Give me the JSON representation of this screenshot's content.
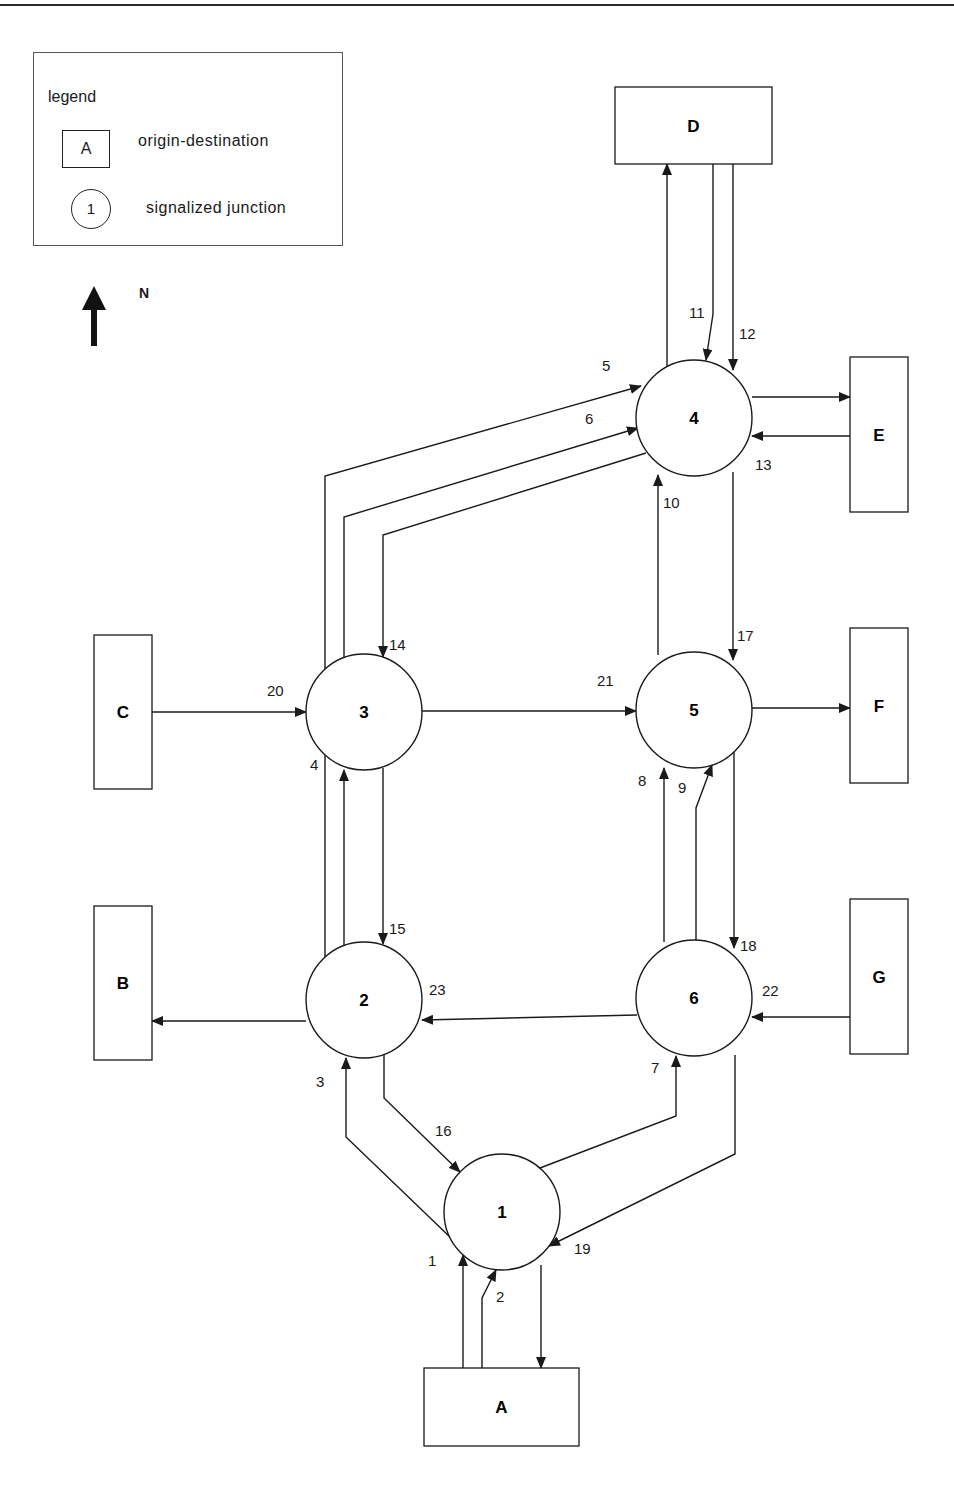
{
  "legend": {
    "title": "legend",
    "od_symbol": "A",
    "od_label": "origin-destination",
    "junction_symbol": "1",
    "junction_label": "signalized junction"
  },
  "north": {
    "label": "N",
    "icon": "north-arrow-icon"
  },
  "od_zones": [
    {
      "id": "A",
      "x": 424,
      "y": 1368,
      "w": 155,
      "h": 78
    },
    {
      "id": "B",
      "x": 94,
      "y": 906,
      "w": 58,
      "h": 154
    },
    {
      "id": "C",
      "x": 94,
      "y": 635,
      "w": 58,
      "h": 154
    },
    {
      "id": "D",
      "x": 615,
      "y": 87,
      "w": 157,
      "h": 77
    },
    {
      "id": "E",
      "x": 850,
      "y": 357,
      "w": 58,
      "h": 155
    },
    {
      "id": "F",
      "x": 850,
      "y": 628,
      "w": 58,
      "h": 155
    },
    {
      "id": "G",
      "x": 850,
      "y": 899,
      "w": 58,
      "h": 155
    }
  ],
  "junctions": [
    {
      "id": "1",
      "cx": 502,
      "cy": 1212,
      "r": 58
    },
    {
      "id": "2",
      "cx": 364,
      "cy": 1000,
      "r": 58
    },
    {
      "id": "3",
      "cx": 364,
      "cy": 712,
      "r": 58
    },
    {
      "id": "4",
      "cx": 694,
      "cy": 418,
      "r": 58
    },
    {
      "id": "5",
      "cx": 694,
      "cy": 710,
      "r": 58
    },
    {
      "id": "6",
      "cx": 694,
      "cy": 998,
      "r": 58
    }
  ],
  "links": [
    {
      "id": "1",
      "from": "A",
      "to": "1",
      "points": [
        [
          463,
          1368
        ],
        [
          463,
          1255
        ]
      ],
      "label": {
        "x": 428,
        "y": 1266
      }
    },
    {
      "id": "2",
      "from": "A",
      "to": "1",
      "points": [
        [
          482,
          1368
        ],
        [
          482,
          1298
        ],
        [
          496,
          1270
        ]
      ],
      "label": {
        "x": 496,
        "y": 1302
      }
    },
    {
      "id": "3",
      "from": "1",
      "to": "2",
      "points": [
        [
          451,
          1238
        ],
        [
          346,
          1137
        ],
        [
          346,
          1058
        ]
      ],
      "label": {
        "x": 316,
        "y": 1087
      }
    },
    {
      "id": "4",
      "from": "2",
      "to": "3",
      "points": [
        [
          344,
          945
        ],
        [
          344,
          770
        ]
      ],
      "label": {
        "x": 310,
        "y": 770
      }
    },
    {
      "id": "5",
      "from": "3",
      "to": "4",
      "points": [
        [
          325,
          958
        ],
        [
          325,
          476
        ],
        [
          641,
          386
        ]
      ],
      "label": {
        "x": 602,
        "y": 371
      }
    },
    {
      "id": "6",
      "from": "3",
      "to": "4",
      "points": [
        [
          344,
          657
        ],
        [
          344,
          517
        ],
        [
          638,
          428
        ]
      ],
      "label": {
        "x": 585,
        "y": 424
      }
    },
    {
      "id": "7",
      "from": "1",
      "to": "6",
      "points": [
        [
          540,
          1168
        ],
        [
          676,
          1116
        ],
        [
          676,
          1056
        ]
      ],
      "label": {
        "x": 651,
        "y": 1073
      }
    },
    {
      "id": "8",
      "from": "6",
      "to": "5",
      "points": [
        [
          664,
          942
        ],
        [
          664,
          768
        ]
      ],
      "label": {
        "x": 638,
        "y": 786
      }
    },
    {
      "id": "9",
      "from": "6",
      "to": "5",
      "points": [
        [
          696,
          940
        ],
        [
          696,
          808
        ],
        [
          712,
          765
        ]
      ],
      "label": {
        "x": 678,
        "y": 793
      }
    },
    {
      "id": "10",
      "from": "5",
      "to": "4",
      "points": [
        [
          658,
          655
        ],
        [
          658,
          475
        ]
      ],
      "label": {
        "x": 663,
        "y": 508
      }
    },
    {
      "id": "11",
      "from": "D",
      "to": "4",
      "points": [
        [
          713,
          164
        ],
        [
          713,
          314
        ],
        [
          706,
          360
        ]
      ],
      "label": {
        "x": 689,
        "y": 318
      }
    },
    {
      "id": "12",
      "from": "D",
      "to": "4",
      "points": [
        [
          733,
          164
        ],
        [
          733,
          370
        ]
      ],
      "label": {
        "x": 739,
        "y": 339
      }
    },
    {
      "id": "13",
      "from": "E",
      "to": "4",
      "points": [
        [
          850,
          436
        ],
        [
          752,
          436
        ]
      ],
      "label": {
        "x": 755,
        "y": 470
      }
    },
    {
      "id": "14",
      "from": "4",
      "to": "3",
      "points": [
        [
          646,
          453
        ],
        [
          383,
          535
        ],
        [
          383,
          657
        ]
      ],
      "label": {
        "x": 389,
        "y": 650
      }
    },
    {
      "id": "15",
      "from": "3",
      "to": "2",
      "points": [
        [
          383,
          768
        ],
        [
          383,
          944
        ]
      ],
      "label": {
        "x": 389,
        "y": 934
      }
    },
    {
      "id": "16",
      "from": "2",
      "to": "1",
      "points": [
        [
          384,
          1055
        ],
        [
          384,
          1098
        ],
        [
          460,
          1172
        ]
      ],
      "label": {
        "x": 435,
        "y": 1136
      }
    },
    {
      "id": "17",
      "from": "4",
      "to": "5",
      "points": [
        [
          733,
          472
        ],
        [
          733,
          660
        ]
      ],
      "label": {
        "x": 737,
        "y": 641
      }
    },
    {
      "id": "18",
      "from": "5",
      "to": "6",
      "points": [
        [
          734,
          752
        ],
        [
          734,
          948
        ]
      ],
      "label": {
        "x": 740,
        "y": 951
      }
    },
    {
      "id": "19",
      "from": "6",
      "to": "1",
      "points": [
        [
          735,
          1055
        ],
        [
          735,
          1154
        ],
        [
          549,
          1246
        ]
      ],
      "label": {
        "x": 574,
        "y": 1254
      }
    },
    {
      "id": "20",
      "from": "C",
      "to": "3",
      "points": [
        [
          152,
          712
        ],
        [
          306,
          712
        ]
      ],
      "label": {
        "x": 267,
        "y": 696
      }
    },
    {
      "id": "21",
      "from": "3",
      "to": "5",
      "points": [
        [
          422,
          711
        ],
        [
          636,
          711
        ]
      ],
      "label": {
        "x": 597,
        "y": 686
      }
    },
    {
      "id": "22",
      "from": "G",
      "to": "6",
      "points": [
        [
          850,
          1017
        ],
        [
          752,
          1017
        ]
      ],
      "label": {
        "x": 762,
        "y": 996
      }
    },
    {
      "id": "23",
      "from": "6",
      "to": "2",
      "points": [
        [
          637,
          1015
        ],
        [
          422,
          1020
        ]
      ],
      "label": {
        "x": 429,
        "y": 995
      }
    },
    {
      "id": "4-D",
      "from": "4",
      "to": "D",
      "points": [
        [
          667,
          366
        ],
        [
          667,
          164
        ]
      ],
      "label": null
    },
    {
      "id": "4-E",
      "from": "4",
      "to": "E",
      "points": [
        [
          752,
          397
        ],
        [
          850,
          397
        ]
      ],
      "label": null
    },
    {
      "id": "5-F",
      "from": "5",
      "to": "F",
      "points": [
        [
          752,
          708
        ],
        [
          850,
          708
        ]
      ],
      "label": null
    },
    {
      "id": "2-B",
      "from": "2",
      "to": "B",
      "points": [
        [
          306,
          1021
        ],
        [
          152,
          1021
        ]
      ],
      "label": null
    },
    {
      "id": "1-A",
      "from": "1",
      "to": "A",
      "points": [
        [
          541,
          1265
        ],
        [
          541,
          1368
        ]
      ],
      "label": null
    }
  ],
  "style": {
    "stroke": "#1a1a1a",
    "fill": "#ffffff"
  }
}
